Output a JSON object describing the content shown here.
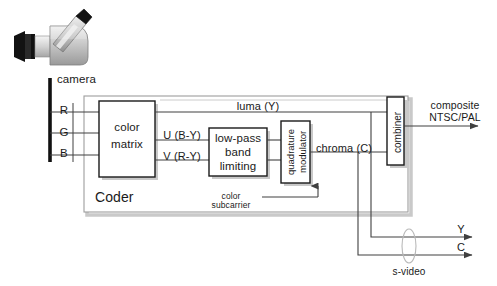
{
  "figure": {
    "caption": ""
  },
  "colors": {
    "line": "#404040",
    "box_border": "#1a1a1a",
    "coder_border": "#999999",
    "shadow": "#c8c8c8",
    "background": "#ffffff",
    "camera_dark": "#1a1a1a",
    "camera_body": "#c0c0c0",
    "camera_light": "#e0e0e0"
  },
  "camera": {
    "icon": "video-camera-icon",
    "label": "camera"
  },
  "inputs": [
    {
      "id": "r",
      "label": "R"
    },
    {
      "id": "g",
      "label": "G"
    },
    {
      "id": "b",
      "label": "B"
    }
  ],
  "blocks": {
    "color_matrix": {
      "label": "color\nmatrix",
      "line1": "color",
      "line2": "matrix"
    },
    "low_pass": {
      "label": "low-pass band limiting",
      "line1": "low-pass",
      "line2": "band",
      "line3": "limiting"
    },
    "quadrature_modulator": {
      "label": "quadrature modulator",
      "line1": "quadrature",
      "line2": "modulator"
    },
    "combiner": {
      "label": "combiner"
    },
    "coder": {
      "label": "Coder"
    }
  },
  "signals": {
    "luma": "luma (Y)",
    "u": "U (B-Y)",
    "v": "V (R-Y)",
    "chroma": "chroma (C)",
    "color_subcarrier_line1": "color",
    "color_subcarrier_line2": "subcarrier"
  },
  "outputs": {
    "composite_line1": "composite",
    "composite_line2": "NTSC/PAL",
    "y": "Y",
    "c": "C",
    "svideo": "s-video"
  }
}
